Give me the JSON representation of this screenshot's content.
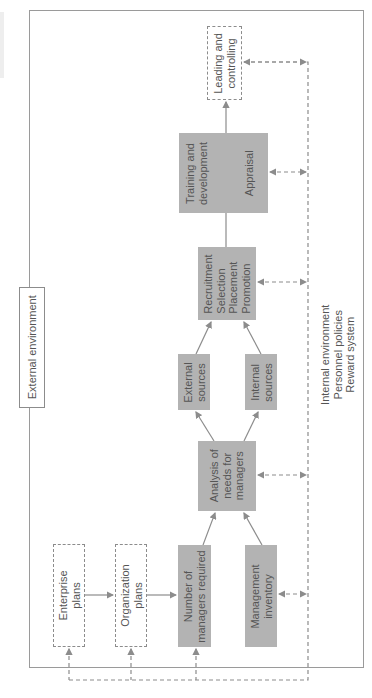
{
  "diagram": {
    "title": "External environment",
    "orientation": "rotated -90 degrees",
    "nodes": {
      "leading": {
        "lines": [
          "Leading and",
          "controlling"
        ],
        "style": "dashed"
      },
      "training": {
        "lines": [
          "Training and",
          "development"
        ],
        "style": "gray"
      },
      "appraisal": {
        "lines": [
          "Appraisal"
        ],
        "style": "gray"
      },
      "recruitment": {
        "lines": [
          "Recruitment",
          "Selection",
          "Placement",
          "Promotion"
        ],
        "style": "gray"
      },
      "external_sources": {
        "lines": [
          "External",
          "sources"
        ],
        "style": "gray"
      },
      "internal_sources": {
        "lines": [
          "Internal",
          "sources"
        ],
        "style": "gray"
      },
      "analysis": {
        "lines": [
          "Analysis of",
          "needs for",
          "managers"
        ],
        "style": "gray"
      },
      "enterprise": {
        "lines": [
          "Enterprise",
          "plans"
        ],
        "style": "dashed"
      },
      "organization": {
        "lines": [
          "Organization",
          "plans"
        ],
        "style": "dashed"
      },
      "number": {
        "lines": [
          "Number of",
          "managers required"
        ],
        "style": "gray"
      },
      "inventory": {
        "lines": [
          "Management",
          "inventory"
        ],
        "style": "gray"
      }
    },
    "internal_env": {
      "lines": [
        "Internal environment",
        "Personnel policies",
        "Reward system"
      ]
    },
    "colors": {
      "gray_box": "#b3b3b3",
      "line": "#8c8c8c",
      "frame": "#9a9a9a"
    }
  }
}
